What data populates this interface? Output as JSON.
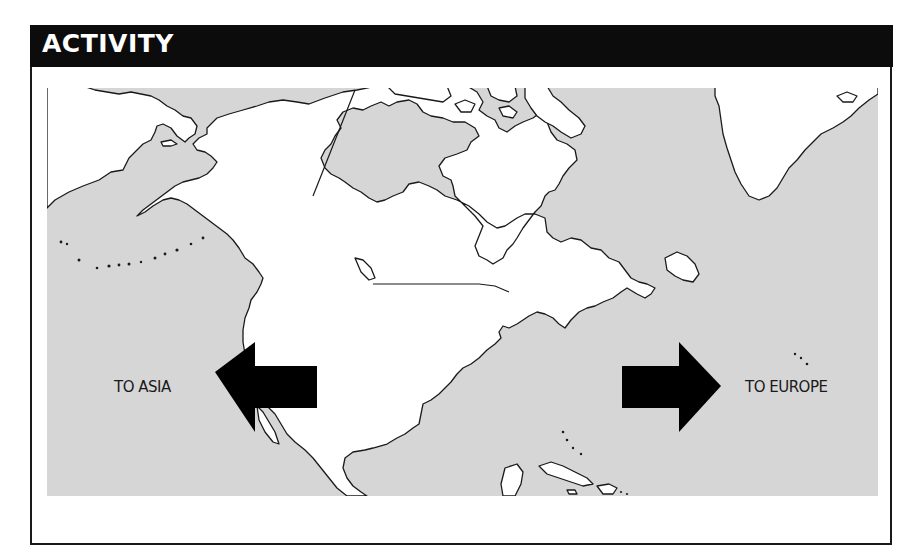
{
  "header": {
    "title": "ACTIVITY"
  },
  "map": {
    "region": "North America outline map",
    "water_color": "#d6d6d6",
    "land_color": "#ffffff",
    "outline_color": "#1a1a1a",
    "labels": {
      "left": "TO ASIA",
      "right": "TO EUROPE"
    },
    "arrows": [
      {
        "direction": "left",
        "color": "#000000"
      },
      {
        "direction": "right",
        "color": "#000000"
      }
    ]
  }
}
